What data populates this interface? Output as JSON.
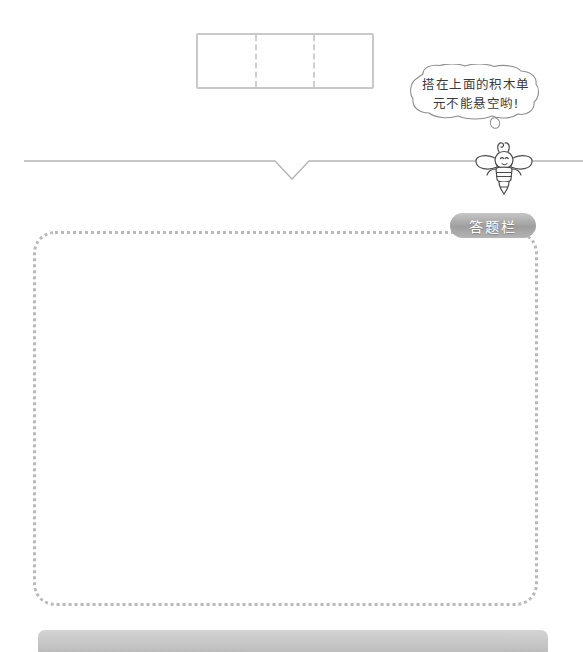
{
  "page": {
    "background_color": "#ffffff",
    "width": 583,
    "height": 642
  },
  "answer_strip": {
    "name": "top-answer-strip",
    "cell_count": 3,
    "cells": [
      "",
      "",
      ""
    ],
    "border_color": "#c9c9c9",
    "divider_style": "dashed"
  },
  "hint": {
    "bubble_text_line1": "搭在上面的积木单",
    "bubble_text_line2": "元不能悬空哟!",
    "bubble_text_full": "搭在上面的积木单元不能悬空哟!"
  },
  "mascot": {
    "name": "bee",
    "icon": "bee-icon"
  },
  "answer_panel": {
    "tab_label": "答题栏",
    "tab_color": "#9e9e9e",
    "border_color": "#b9b9b9",
    "border_style": "dotted"
  },
  "figures": [
    {
      "id": "figure-1",
      "label": "",
      "cube_count": 3,
      "description": "isometric block: two cubes in a row with one cube stacked on the right cube",
      "answer_value": "",
      "answer_placeholder": ""
    },
    {
      "id": "figure-2",
      "label": "",
      "cube_count": 3,
      "description": "isometric block: two cubes in a row with one cube stacked on the back-right cube",
      "answer_value": "",
      "answer_placeholder": ""
    },
    {
      "id": "figure-3",
      "label": "",
      "cube_count": 4,
      "description": "isometric block: three cubes in a row with one cube stacked on the rightmost cube",
      "answer_value": "",
      "answer_placeholder": ""
    }
  ],
  "colors": {
    "cube_stroke": "#333333",
    "cube_fill": "#ffffff",
    "answer_box_border": "#dedede",
    "divider": "#b5b5b5",
    "bottom_bar": "#c4c4c4"
  }
}
